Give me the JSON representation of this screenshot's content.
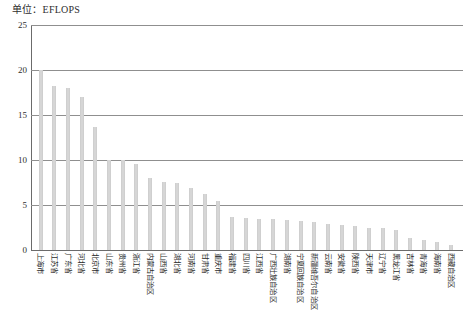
{
  "unit_caption": "单位：EFLOPS",
  "chart_data": {
    "type": "bar",
    "title": "单位：EFLOPS",
    "xlabel": "",
    "ylabel": "EFLOPS",
    "ylim": [
      0,
      25
    ],
    "yticks": [
      0,
      5,
      10,
      15,
      20,
      25
    ],
    "grid": true,
    "legend": "none",
    "bar_color": "#d6d6d6",
    "categories": [
      "上海市",
      "江苏省",
      "广东省",
      "河北省",
      "北京市",
      "山东省",
      "贵州省",
      "浙江省",
      "内蒙古自治区",
      "山西省",
      "湖北省",
      "河南省",
      "甘肃省",
      "重庆市",
      "福建省",
      "四川省",
      "江西省",
      "广西壮族自治区",
      "湖南省",
      "宁夏回族自治区",
      "新疆维吾尔自治区",
      "云南省",
      "安徽省",
      "陕西省",
      "天津市",
      "辽宁省",
      "黑龙江省",
      "吉林省",
      "青海省",
      "海南省",
      "西藏自治区"
    ],
    "values": [
      20.0,
      18.2,
      18.0,
      17.0,
      13.7,
      10.0,
      10.0,
      9.6,
      8.0,
      7.6,
      7.4,
      6.9,
      6.2,
      5.4,
      3.7,
      3.6,
      3.5,
      3.4,
      3.3,
      3.2,
      3.1,
      2.9,
      2.8,
      2.7,
      2.5,
      2.4,
      2.2,
      1.3,
      1.1,
      0.9,
      0.6
    ]
  }
}
